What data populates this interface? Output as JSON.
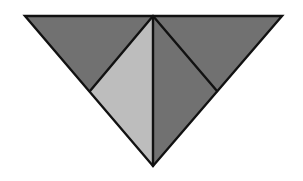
{
  "diagram": {
    "canvas": {
      "width": 303,
      "height": 181,
      "background": "#ffffff"
    },
    "stroke": {
      "color": "#111111",
      "width": 2.4
    },
    "colors": {
      "dark": "#717171",
      "light": "#bdbdbd"
    },
    "outer_triangle": {
      "points": "25,16 282,16 153,166"
    },
    "regions": [
      {
        "name": "top-left-dark-triangle",
        "points": "25,16 153,16 90,91",
        "fill": "#717171"
      },
      {
        "name": "center-left-light-triangle",
        "points": "153,16 90,91 153,166",
        "fill": "#bdbdbd"
      },
      {
        "name": "center-right-dark-triangle",
        "points": "153,16 217,91 153,166",
        "fill": "#717171"
      },
      {
        "name": "top-right-dark-triangle",
        "points": "153,16 282,16 217,91",
        "fill": "#717171"
      }
    ],
    "lines": [
      {
        "name": "vertical-center-line",
        "x1": 153,
        "y1": 16,
        "x2": 153,
        "y2": 166
      },
      {
        "name": "left-diagonal-line",
        "x1": 153,
        "y1": 16,
        "x2": 90,
        "y2": 91
      },
      {
        "name": "right-diagonal-line",
        "x1": 153,
        "y1": 16,
        "x2": 217,
        "y2": 91
      }
    ]
  }
}
